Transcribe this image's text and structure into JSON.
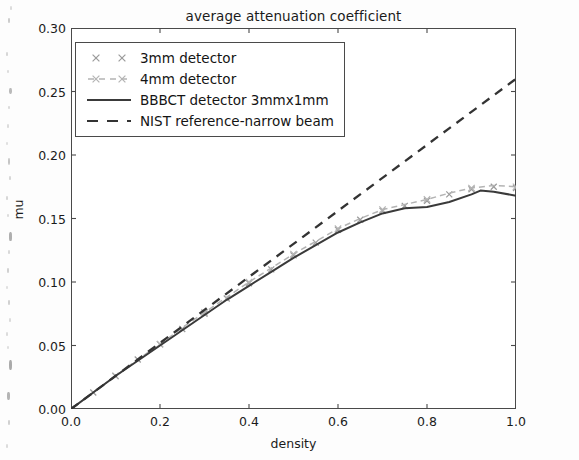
{
  "chart_data": {
    "type": "line",
    "title": "average attenuation coefficient",
    "xlabel": "density",
    "ylabel": "mu",
    "xlim": [
      0.0,
      1.0
    ],
    "ylim": [
      0.0,
      0.3
    ],
    "xticks": [
      "0.0",
      "0.2",
      "0.4",
      "0.6",
      "0.8",
      "1.0"
    ],
    "xtick_values": [
      0.0,
      0.2,
      0.4,
      0.6,
      0.8,
      1.0
    ],
    "yticks": [
      "0.00",
      "0.05",
      "0.10",
      "0.15",
      "0.20",
      "0.25",
      "0.30"
    ],
    "ytick_values": [
      0.0,
      0.05,
      0.1,
      0.15,
      0.2,
      0.25,
      0.3
    ],
    "grid": false,
    "legend_position": "upper left",
    "series": [
      {
        "name": "3mm detector",
        "style": "markers",
        "marker": "x",
        "color": "#9a9a9a",
        "x": [
          0.0,
          0.05,
          0.1,
          0.15,
          0.2,
          0.25,
          0.3,
          0.35,
          0.4,
          0.45,
          0.5,
          0.55,
          0.6,
          0.65,
          0.7,
          0.75,
          0.8,
          0.85,
          0.9,
          0.95,
          1.0
        ],
        "y": [
          0.0,
          0.013,
          0.026,
          0.039,
          0.051,
          0.063,
          0.075,
          0.087,
          0.099,
          0.11,
          0.121,
          0.131,
          0.141,
          0.149,
          0.156,
          0.16,
          0.164,
          0.169,
          0.173,
          0.175,
          0.174
        ]
      },
      {
        "name": "4mm detector",
        "style": "dashed-markers",
        "marker": "x",
        "color": "#b4b4b4",
        "x": [
          0.0,
          0.05,
          0.1,
          0.15,
          0.2,
          0.25,
          0.3,
          0.35,
          0.4,
          0.45,
          0.5,
          0.55,
          0.6,
          0.65,
          0.7,
          0.75,
          0.8,
          0.85,
          0.9,
          0.95,
          1.0
        ],
        "y": [
          0.0,
          0.013,
          0.026,
          0.039,
          0.051,
          0.064,
          0.076,
          0.088,
          0.1,
          0.111,
          0.122,
          0.132,
          0.142,
          0.15,
          0.157,
          0.161,
          0.165,
          0.17,
          0.174,
          0.176,
          0.175
        ]
      },
      {
        "name": "BBBCT detector 3mmx1mm",
        "style": "solid",
        "color": "#3a3a3a",
        "x": [
          0.0,
          0.05,
          0.1,
          0.15,
          0.2,
          0.25,
          0.3,
          0.35,
          0.4,
          0.45,
          0.5,
          0.55,
          0.6,
          0.65,
          0.7,
          0.75,
          0.8,
          0.85,
          0.9,
          0.92,
          0.95,
          1.0
        ],
        "y": [
          0.0,
          0.013,
          0.026,
          0.038,
          0.05,
          0.062,
          0.074,
          0.086,
          0.097,
          0.108,
          0.119,
          0.129,
          0.139,
          0.147,
          0.154,
          0.158,
          0.159,
          0.163,
          0.169,
          0.172,
          0.171,
          0.168
        ]
      },
      {
        "name": "NIST reference-narrow beam",
        "style": "dashed",
        "color": "#333333",
        "x": [
          0.0,
          0.2,
          0.4,
          0.6,
          0.8,
          1.0
        ],
        "y": [
          0.0,
          0.052,
          0.104,
          0.156,
          0.208,
          0.26
        ]
      }
    ]
  },
  "legend": {
    "entries": [
      {
        "label": "3mm detector",
        "key": "x-marker-gray"
      },
      {
        "label": "4mm detector",
        "key": "x-marker-dashed-light"
      },
      {
        "label": "BBBCT detector 3mmx1mm",
        "key": "solid-line-dark"
      },
      {
        "label": "NIST reference-narrow beam",
        "key": "dashed-line-dark"
      }
    ]
  },
  "colors": {
    "frame": "#4a4a4a",
    "text": "#1b1b1b",
    "background": "#ffffff",
    "series_3mm": "#9a9a9a",
    "series_4mm": "#b4b4b4",
    "series_bbbct": "#3a3a3a",
    "series_nist": "#333333"
  }
}
